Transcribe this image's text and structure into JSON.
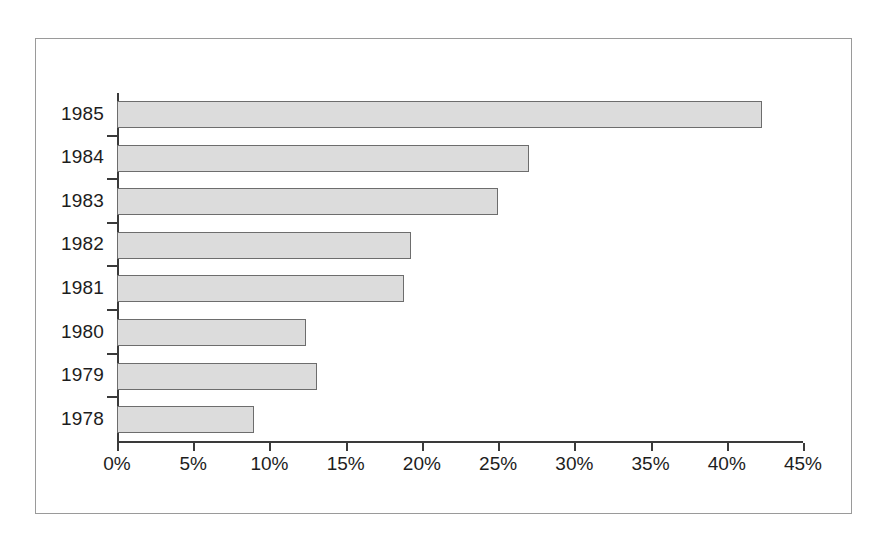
{
  "chart_data": {
    "type": "bar",
    "orientation": "horizontal",
    "title": "",
    "subtitle": "",
    "xlabel": "",
    "ylabel": "",
    "categories": [
      "1985",
      "1984",
      "1983",
      "1982",
      "1981",
      "1980",
      "1979",
      "1978"
    ],
    "values": [
      42.3,
      27.0,
      25.0,
      19.3,
      18.8,
      12.4,
      13.1,
      9.0
    ],
    "value_format": "percent",
    "xlim": [
      0,
      45
    ],
    "xticks": [
      0,
      5,
      10,
      15,
      20,
      25,
      30,
      35,
      40,
      45
    ],
    "xtick_labels": [
      "0%",
      "5%",
      "10%",
      "15%",
      "20%",
      "25%",
      "30%",
      "35%",
      "40%",
      "45%"
    ],
    "grid": false,
    "legend": false,
    "legend_position": "none",
    "series": [
      {
        "name": "",
        "values": [
          42.3,
          27.0,
          25.0,
          19.3,
          18.8,
          12.4,
          13.1,
          9.0
        ]
      }
    ]
  },
  "style": {
    "bar_fill": "#dcdcdc",
    "bar_border": "#6d6d6d",
    "axis_color": "#3a3a3a",
    "text_color": "#1d1d1d",
    "frame_color": "#9a9a9a",
    "background": "#ffffff"
  }
}
